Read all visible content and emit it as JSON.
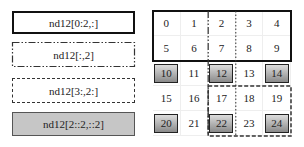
{
  "legend": [
    {
      "label": "nd12[0:2,:]",
      "style": "solid-thick"
    },
    {
      "label": "nd12[:,2]",
      "style": "dash-dot"
    },
    {
      "label": "nd12[3:,2:]",
      "style": "dashed"
    },
    {
      "label": "nd12[2::2,::2]",
      "style": "gray-fill"
    }
  ],
  "grid": {
    "rows": 5,
    "cols": 5,
    "cells": [
      [
        "0",
        "1",
        "2",
        "3",
        "4"
      ],
      [
        "5",
        "6",
        "7",
        "8",
        "9"
      ],
      [
        "10",
        "11",
        "12",
        "13",
        "14"
      ],
      [
        "15",
        "16",
        "17",
        "18",
        "19"
      ],
      [
        "20",
        "21",
        "22",
        "23",
        "24"
      ]
    ],
    "highlighted": [
      "10",
      "12",
      "14",
      "20",
      "22",
      "24"
    ]
  },
  "colors": {
    "highlight_fill_top": "#dddddd",
    "highlight_fill_bottom": "#8a8a8a",
    "legend_gray": "#c6c6c6",
    "line": "#111111"
  }
}
